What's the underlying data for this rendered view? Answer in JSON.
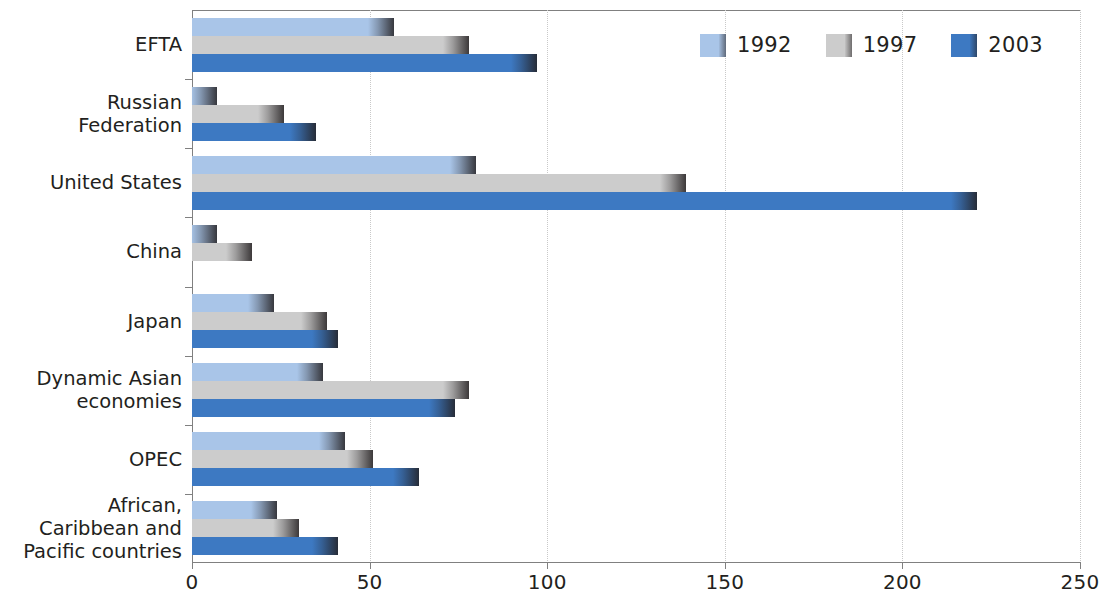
{
  "chart_data": {
    "type": "bar",
    "orientation": "horizontal",
    "title": "",
    "subtitle": "",
    "xlabel": "",
    "ylabel": "",
    "xlim": [
      0,
      250
    ],
    "xticks": [
      0,
      50,
      100,
      150,
      200,
      250
    ],
    "xtick_labels": [
      "0",
      "50",
      "100",
      "150",
      "200",
      "250"
    ],
    "grid": "vertical-dotted",
    "legend_position": "top-right",
    "categories": [
      "EFTA",
      "Russian\nFederation",
      "United States",
      "China",
      "Japan",
      "Dynamic Asian\neconomies",
      "OPEC",
      "African,\nCaribbean and\nPacific countries"
    ],
    "series": [
      {
        "name": "1992",
        "color": "#a9c5e8",
        "values": [
          57,
          7,
          80,
          7,
          23,
          37,
          43,
          24
        ]
      },
      {
        "name": "1997",
        "color": "#cccccc",
        "values": [
          78,
          26,
          139,
          17,
          38,
          78,
          51,
          30
        ]
      },
      {
        "name": "2003",
        "color": "#3d79c2",
        "values": [
          97,
          35,
          221,
          0,
          41,
          74,
          64,
          41
        ]
      }
    ]
  },
  "legend": {
    "items": [
      {
        "label": "1992",
        "color": "#a9c5e8"
      },
      {
        "label": "1997",
        "color": "#cccccc"
      },
      {
        "label": "2003",
        "color": "#3d79c2"
      }
    ]
  },
  "colors": {
    "series_1992": "#a9c5e8",
    "series_1997": "#cccccc",
    "series_2003": "#3d79c2",
    "axis": "#808080",
    "grid": "#c9c9c9",
    "text": "#231f20"
  }
}
